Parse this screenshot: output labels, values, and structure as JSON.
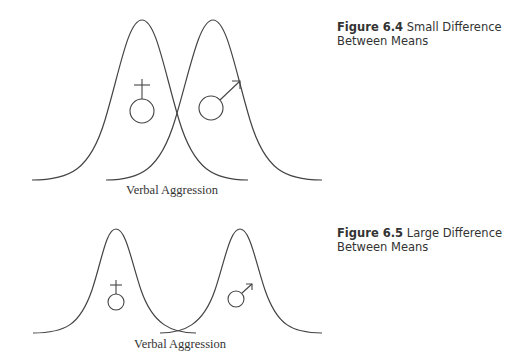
{
  "figures": [
    {
      "number": "Figure 6.4",
      "title": "Small Difference Between Means",
      "title_line1": "Small Difference",
      "title_line2": "Between Means",
      "axis_label": "Verbal Aggression",
      "groups": [
        {
          "symbol": "female-symbol",
          "peak_x": 142
        },
        {
          "symbol": "male-symbol",
          "peak_x": 213
        }
      ]
    },
    {
      "number": "Figure 6.5",
      "title": "Large Difference Between Means",
      "title_line1": "Large Difference",
      "title_line2": "Between Means",
      "axis_label": "Verbal Aggression",
      "groups": [
        {
          "symbol": "female-symbol",
          "peak_x": 116
        },
        {
          "symbol": "male-symbol",
          "peak_x": 240
        }
      ]
    }
  ],
  "colors": {
    "line": "#444444",
    "text": "#333333"
  }
}
